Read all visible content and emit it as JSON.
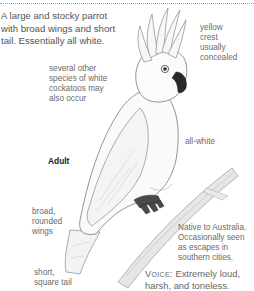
{
  "species_account": {
    "description": "A large and stocky parrot\nwith broad wings and short\ntail. Essentially all white.",
    "age_label": "Adult",
    "annotations": {
      "crest": "yellow\ncrest\nusually\nconcealed",
      "similar_species": "several other\nspecies of white\ncockatoos may\nalso occur",
      "body": "all-white",
      "wings": "broad,\nrounded\nwings",
      "tail": "short,\nsquare tail",
      "range": "Native to Australia.\nOccasionally seen\nas escapes in\nsouthern cities."
    },
    "voice": {
      "label": "Voice:",
      "text": " Extremely loud,\nharsh, and toneless."
    }
  },
  "colors": {
    "text": "#555555",
    "label": "#6a6a6a",
    "heading": "#222222",
    "feet": "#4a4a4a",
    "bill": "#2a2a2a",
    "branch": "#d8d8d8"
  }
}
